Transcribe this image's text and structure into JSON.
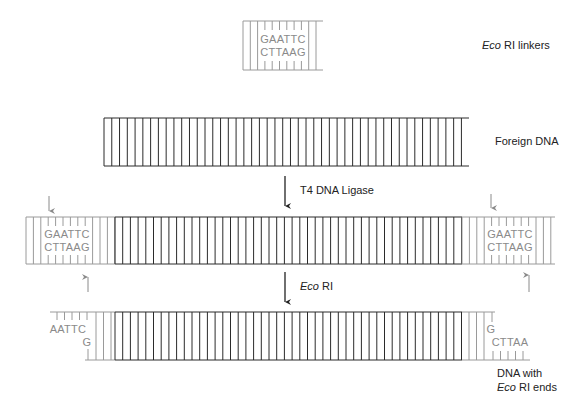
{
  "linker": {
    "label_italic": "Eco",
    "label_rest": " RI linkers",
    "seq_top": "GAATTC",
    "seq_bottom": "CTTAAG"
  },
  "foreign_dna": {
    "label": "Foreign DNA"
  },
  "step1": {
    "label": "T4 DNA Ligase"
  },
  "ligated": {
    "left_seq_top": "GAATTC",
    "left_seq_bottom": "CTTAAG",
    "right_seq_top": "GAATTC",
    "right_seq_bottom": "CTTAAG"
  },
  "step2": {
    "label_italic": "Eco",
    "label_rest": " RI"
  },
  "digested": {
    "left_top": "AATTC",
    "left_bottom": "G",
    "right_top": "G",
    "right_bottom": "CTTAA",
    "label_line1": "DNA with",
    "label_line2_italic": "Eco",
    "label_line2_rest": " RI ends"
  },
  "colors": {
    "dark": "#2b2b2b",
    "gray": "#9a9a9a",
    "seq": "#8a8a8a",
    "text": "#222222"
  }
}
